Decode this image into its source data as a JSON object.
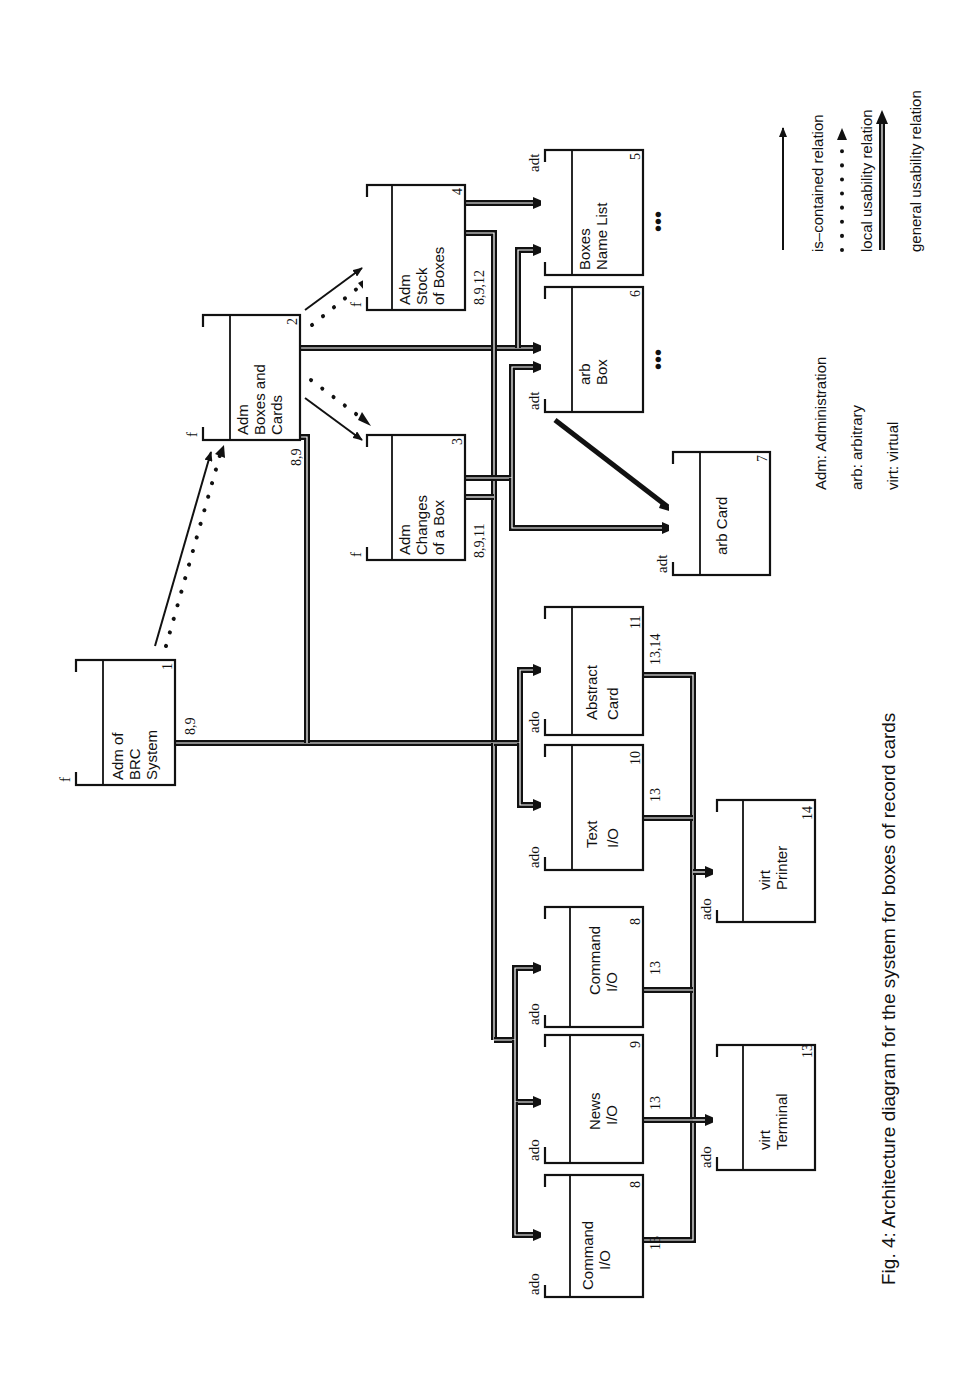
{
  "caption": "Fig. 4: Architecture diagram for the system for boxes of record cards",
  "modules": [
    {
      "id": "1",
      "kind": "f",
      "lines": [
        "Adm of",
        "BRC",
        "System"
      ],
      "uses": "8,9"
    },
    {
      "id": "2",
      "kind": "f",
      "lines": [
        "Adm",
        "Boxes and",
        "Cards"
      ],
      "uses": "8,9"
    },
    {
      "id": "3",
      "kind": "f",
      "lines": [
        "Adm",
        "Changes",
        "of a Box"
      ],
      "uses": "8,9,11"
    },
    {
      "id": "4",
      "kind": "f",
      "lines": [
        "Adm",
        "Stock",
        "of Boxes"
      ],
      "uses": "8,9,12"
    },
    {
      "id": "5",
      "kind": "adt",
      "lines": [
        "Boxes",
        "Name List"
      ],
      "uses": ""
    },
    {
      "id": "6",
      "kind": "adt",
      "lines": [
        "arb",
        "Box"
      ],
      "uses": ""
    },
    {
      "id": "7",
      "kind": "adt",
      "lines": [
        "arb Card"
      ],
      "uses": ""
    },
    {
      "id": "8",
      "kind": "ado",
      "lines": [
        "Command",
        "I/O"
      ],
      "uses": "13"
    },
    {
      "id": "9",
      "kind": "ado",
      "lines": [
        "News",
        "I/O"
      ],
      "uses": "13"
    },
    {
      "id": "10",
      "kind": "ado",
      "lines": [
        "Text",
        "I/O"
      ],
      "uses": "13"
    },
    {
      "id": "11",
      "kind": "ado",
      "lines": [
        "Abstract",
        "Card"
      ],
      "uses": "13,14"
    },
    {
      "id": "12",
      "kind": "ado",
      "lines": [
        "Abstract",
        "Box List"
      ],
      "uses": "13,14"
    },
    {
      "id": "13",
      "kind": "ado",
      "lines": [
        "virt",
        "Terminal"
      ],
      "uses": ""
    },
    {
      "id": "14",
      "kind": "ado",
      "lines": [
        "virt",
        "Printer"
      ],
      "uses": ""
    }
  ],
  "ellipsis": "•••",
  "abbreviations": [
    {
      "text": "Adm:  Administration"
    },
    {
      "text": "arb:  arbitrary"
    },
    {
      "text": "virt:  virtual"
    }
  ],
  "legend": [
    {
      "style": "solid-thin",
      "label": "is–contained relation"
    },
    {
      "style": "dotted",
      "label": "local usability relation"
    },
    {
      "style": "double",
      "label": "general usability relation"
    }
  ]
}
